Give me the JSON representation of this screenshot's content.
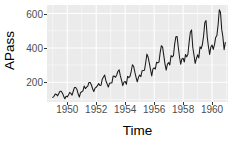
{
  "chart_data": {
    "type": "line",
    "title": "",
    "subtitle": "",
    "xlabel": "Time",
    "ylabel": "APass",
    "xlim": [
      1948.6,
      1961.1
    ],
    "ylim": [
      85,
      650
    ],
    "grid": true,
    "legend": null,
    "background": "#ebebeb",
    "gridline_color": "#ffffff",
    "line_color": "#1a1a1a",
    "x_ticks": [
      1950,
      1952,
      1954,
      1956,
      1958,
      1960
    ],
    "x_tick_labels": [
      "1950",
      "1952",
      "1954",
      "1956",
      "1958",
      "1960"
    ],
    "x_minor_ticks": [
      1949,
      1951,
      1953,
      1955,
      1957,
      1959,
      1961
    ],
    "y_ticks": [
      200,
      400,
      600
    ],
    "y_tick_labels": [
      "200",
      "400",
      "600"
    ],
    "y_minor_ticks": [
      100,
      300,
      500
    ],
    "series": [
      {
        "name": "APass",
        "x": [
          1949.0,
          1949.083,
          1949.167,
          1949.25,
          1949.333,
          1949.417,
          1949.5,
          1949.583,
          1949.667,
          1949.75,
          1949.833,
          1949.917,
          1950.0,
          1950.083,
          1950.167,
          1950.25,
          1950.333,
          1950.417,
          1950.5,
          1950.583,
          1950.667,
          1950.75,
          1950.833,
          1950.917,
          1951.0,
          1951.083,
          1951.167,
          1951.25,
          1951.333,
          1951.417,
          1951.5,
          1951.583,
          1951.667,
          1951.75,
          1951.833,
          1951.917,
          1952.0,
          1952.083,
          1952.167,
          1952.25,
          1952.333,
          1952.417,
          1952.5,
          1952.583,
          1952.667,
          1952.75,
          1952.833,
          1952.917,
          1953.0,
          1953.083,
          1953.167,
          1953.25,
          1953.333,
          1953.417,
          1953.5,
          1953.583,
          1953.667,
          1953.75,
          1953.833,
          1953.917,
          1954.0,
          1954.083,
          1954.167,
          1954.25,
          1954.333,
          1954.417,
          1954.5,
          1954.583,
          1954.667,
          1954.75,
          1954.833,
          1954.917,
          1955.0,
          1955.083,
          1955.167,
          1955.25,
          1955.333,
          1955.417,
          1955.5,
          1955.583,
          1955.667,
          1955.75,
          1955.833,
          1955.917,
          1956.0,
          1956.083,
          1956.167,
          1956.25,
          1956.333,
          1956.417,
          1956.5,
          1956.583,
          1956.667,
          1956.75,
          1956.833,
          1956.917,
          1957.0,
          1957.083,
          1957.167,
          1957.25,
          1957.333,
          1957.417,
          1957.5,
          1957.583,
          1957.667,
          1957.75,
          1957.833,
          1957.917,
          1958.0,
          1958.083,
          1958.167,
          1958.25,
          1958.333,
          1958.417,
          1958.5,
          1958.583,
          1958.667,
          1958.75,
          1958.833,
          1958.917,
          1959.0,
          1959.083,
          1959.167,
          1959.25,
          1959.333,
          1959.417,
          1959.5,
          1959.583,
          1959.667,
          1959.75,
          1959.833,
          1959.917,
          1960.0,
          1960.083,
          1960.167,
          1960.25,
          1960.333,
          1960.417,
          1960.5,
          1960.583,
          1960.667,
          1960.75,
          1960.833,
          1960.917
        ],
        "values": [
          112,
          118,
          132,
          129,
          121,
          135,
          148,
          148,
          136,
          119,
          104,
          118,
          115,
          126,
          141,
          135,
          125,
          149,
          170,
          170,
          158,
          133,
          114,
          140,
          145,
          150,
          178,
          163,
          172,
          178,
          199,
          199,
          184,
          162,
          146,
          166,
          171,
          180,
          193,
          181,
          183,
          218,
          230,
          242,
          209,
          191,
          172,
          194,
          196,
          196,
          236,
          235,
          229,
          243,
          264,
          272,
          237,
          211,
          180,
          201,
          204,
          188,
          235,
          227,
          234,
          264,
          302,
          293,
          259,
          229,
          203,
          229,
          242,
          233,
          267,
          269,
          270,
          315,
          364,
          347,
          312,
          274,
          237,
          278,
          284,
          277,
          317,
          313,
          318,
          374,
          413,
          405,
          355,
          306,
          271,
          306,
          315,
          301,
          356,
          348,
          355,
          422,
          465,
          467,
          404,
          347,
          305,
          336,
          340,
          318,
          362,
          348,
          363,
          435,
          491,
          505,
          404,
          359,
          310,
          337,
          360,
          342,
          406,
          396,
          420,
          472,
          548,
          559,
          463,
          407,
          362,
          405,
          417,
          391,
          419,
          461,
          472,
          535,
          622,
          606,
          508,
          461,
          390,
          432
        ]
      }
    ]
  }
}
